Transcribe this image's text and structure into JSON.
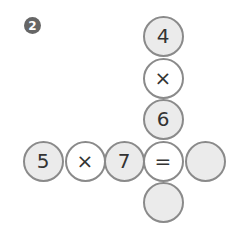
{
  "problem_number": "2",
  "cells": [
    {
      "id": "v1",
      "value": "4",
      "type": "num",
      "x": 163,
      "y": 36
    },
    {
      "id": "v2",
      "value": "×",
      "type": "op",
      "x": 163,
      "y": 78
    },
    {
      "id": "v3",
      "value": "6",
      "type": "num",
      "x": 163,
      "y": 119
    },
    {
      "id": "h1",
      "value": "5",
      "type": "num",
      "x": 43,
      "y": 161
    },
    {
      "id": "h2",
      "value": "×",
      "type": "op",
      "x": 85,
      "y": 161
    },
    {
      "id": "h3",
      "value": "7",
      "type": "num",
      "x": 124,
      "y": 161
    },
    {
      "id": "eq",
      "value": "=",
      "type": "op",
      "x": 163,
      "y": 161
    },
    {
      "id": "ans_h",
      "value": "",
      "type": "blank",
      "x": 205,
      "y": 161
    },
    {
      "id": "ans_v",
      "value": "",
      "type": "blank",
      "x": 163,
      "y": 202
    }
  ]
}
